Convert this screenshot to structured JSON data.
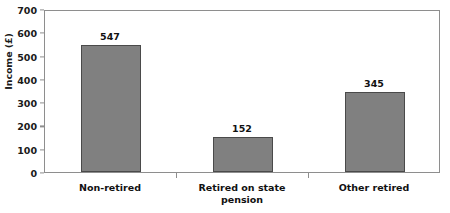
{
  "chart_data": {
    "type": "bar",
    "title": "",
    "xlabel": "",
    "ylabel": "Income (£)",
    "categories": [
      "Non-retired",
      "Retired on state pension",
      "Other retired"
    ],
    "values": [
      547,
      152,
      345
    ],
    "value_labels": [
      "547",
      "152",
      "345"
    ],
    "ylim": [
      0,
      700
    ],
    "yticks": [
      0,
      100,
      200,
      300,
      400,
      500,
      600,
      700
    ],
    "ytick_labels": [
      "0",
      "100",
      "200",
      "300",
      "400",
      "500",
      "600",
      "700"
    ],
    "grid": false,
    "legend": false,
    "bar_color": "#808080",
    "bar_border_color": "#4a4a4a",
    "axis_color": "#8e8e8e",
    "text_color": "#111111",
    "background": "#ffffff"
  },
  "axis": {
    "y_title": "Income (£)"
  },
  "category_label_lines": [
    [
      "Non-retired"
    ],
    [
      "Retired on state",
      "pension"
    ],
    [
      "Other retired"
    ]
  ]
}
